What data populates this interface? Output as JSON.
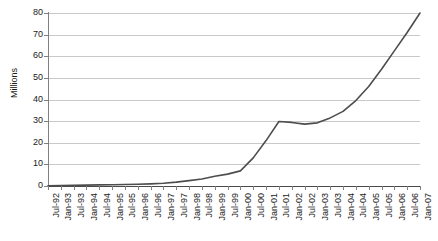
{
  "chart_data": {
    "type": "line",
    "title": "",
    "subtitle": "",
    "xlabel": "",
    "ylabel": "Millions",
    "ylim": [
      0,
      80
    ],
    "ytick_step": 10,
    "yticks": [
      0,
      10,
      20,
      30,
      40,
      50,
      60,
      70,
      80
    ],
    "grid": true,
    "grid_axis": "y",
    "legend": false,
    "legend_position": "none",
    "categories": [
      "Jul-92",
      "Jan-93",
      "Jul-93",
      "Jan-94",
      "Jul-94",
      "Jan-95",
      "Jul-95",
      "Jan-96",
      "Jul-96",
      "Jan-97",
      "Jul-97",
      "Jan-98",
      "Jul-98",
      "Jan-99",
      "Jul-99",
      "Jan-00",
      "Jul-00",
      "Jan-01",
      "Jul-01",
      "Jan-02",
      "Jul-02",
      "Jan-03",
      "Jul-03",
      "Jan-04",
      "Jul-04",
      "Jan-05",
      "Jul-05",
      "Jan-06",
      "Jul-06",
      "Jan-07"
    ],
    "values": [
      0.1,
      0.2,
      0.3,
      0.4,
      0.5,
      0.6,
      0.7,
      0.8,
      1.0,
      1.3,
      1.8,
      2.5,
      3.2,
      4.5,
      5.5,
      7.0,
      13.0,
      21.0,
      29.8,
      29.4,
      28.6,
      29.2,
      31.5,
      34.5,
      39.5,
      46.0,
      54.0,
      62.5,
      71.0,
      80.0
    ],
    "series": [
      {
        "name": "",
        "color": "#4d4d4d",
        "values": [
          0.1,
          0.2,
          0.3,
          0.4,
          0.5,
          0.6,
          0.7,
          0.8,
          1.0,
          1.3,
          1.8,
          2.5,
          3.2,
          4.5,
          5.5,
          7.0,
          13.0,
          21.0,
          29.8,
          29.4,
          28.6,
          29.2,
          31.5,
          34.5,
          39.5,
          46.0,
          54.0,
          62.5,
          71.0,
          80.0
        ]
      }
    ],
    "colors": {
      "line": "#4d4d4d",
      "gridline": "#c9c9c9",
      "axis": "#808080",
      "axis_x": "#4a4a4a",
      "background": "#ffffff",
      "text": "#1a1a1a"
    }
  }
}
